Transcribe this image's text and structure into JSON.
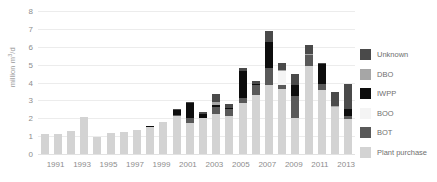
{
  "chart_data": {
    "type": "bar",
    "stacked": true,
    "title": "",
    "xlabel": "",
    "ylabel": "million m3/d",
    "ylabel_html": "million m³/d",
    "ylim": [
      0,
      8
    ],
    "yticks": [
      0,
      1,
      2,
      3,
      4,
      5,
      6,
      7,
      8
    ],
    "grid": true,
    "legend_position": "right",
    "categories": [
      "1990",
      "1991",
      "1992",
      "1993",
      "1994",
      "1995",
      "1996",
      "1997",
      "1998",
      "1999",
      "2000",
      "2001",
      "2002",
      "2003",
      "2004",
      "2005",
      "2006",
      "2007",
      "2008",
      "2009",
      "2010",
      "2011",
      "2012",
      "2013"
    ],
    "tick_labels": [
      "",
      "1991",
      "",
      "1993",
      "",
      "1995",
      "",
      "1997",
      "",
      "1999",
      "",
      "2001",
      "",
      "2003",
      "",
      "2005",
      "",
      "2007",
      "",
      "2009",
      "",
      "2011",
      "",
      "2013"
    ],
    "series": [
      {
        "name": "Plant purchase",
        "color": "#d3d3d3",
        "values": [
          1.1,
          1.1,
          1.3,
          2.05,
          0.95,
          1.2,
          1.25,
          1.32,
          1.5,
          1.8,
          2.1,
          1.75,
          2.0,
          2.25,
          2.1,
          2.85,
          3.3,
          3.85,
          3.65,
          2.0,
          4.9,
          3.6,
          2.65,
          1.95
        ]
      },
      {
        "name": "BOT",
        "color": "#595959",
        "values": [
          0,
          0,
          0,
          0,
          0,
          0,
          0,
          0,
          0,
          0,
          0.1,
          0.25,
          0,
          0.4,
          0.4,
          0.3,
          0.55,
          0.95,
          0.2,
          1.25,
          0.65,
          0.3,
          0,
          0.15
        ]
      },
      {
        "name": "BOO",
        "color": "#f4f4f4",
        "values": [
          0,
          0,
          0,
          0,
          0,
          0,
          0,
          0,
          0,
          0,
          0,
          0,
          0,
          0,
          0,
          0,
          0,
          0,
          0.8,
          0,
          0,
          0,
          0,
          0
        ]
      },
      {
        "name": "IWPP",
        "color": "#0d0d0d",
        "values": [
          0,
          0,
          0,
          0,
          0,
          0,
          0,
          0.05,
          0.05,
          0,
          0.25,
          0.85,
          0.25,
          0.1,
          0.05,
          1.5,
          0.05,
          1.45,
          0,
          0.6,
          0,
          1.15,
          0,
          0.4
        ]
      },
      {
        "name": "DBO",
        "color": "#a6a6a6",
        "values": [
          0,
          0,
          0,
          0,
          0,
          0,
          0,
          0,
          0,
          0,
          0,
          0,
          0,
          0.15,
          0,
          0,
          0,
          0,
          0.05,
          0,
          0.05,
          0,
          0.05,
          0
        ]
      },
      {
        "name": "Unknown",
        "color": "#4a4a4a",
        "values": [
          0,
          0,
          0,
          0,
          0,
          0,
          0,
          0,
          0,
          0,
          0.05,
          0.05,
          0.1,
          0.45,
          0.25,
          0.15,
          0.2,
          0.65,
          0.4,
          0.6,
          0.5,
          0.05,
          0.75,
          1.4
        ]
      }
    ],
    "legend": [
      {
        "label": "Unknown",
        "color": "#4a4a4a"
      },
      {
        "label": "DBO",
        "color": "#a6a6a6"
      },
      {
        "label": "IWPP",
        "color": "#0d0d0d"
      },
      {
        "label": "BOO",
        "color": "#f4f4f4"
      },
      {
        "label": "BOT",
        "color": "#595959"
      },
      {
        "label": "Plant purchase",
        "color": "#d3d3d3"
      }
    ]
  },
  "colors": {
    "grid": "#ececec",
    "axis_text": "#8d8d8d",
    "legend_text": "#6f6f6f",
    "background": "#ffffff"
  }
}
